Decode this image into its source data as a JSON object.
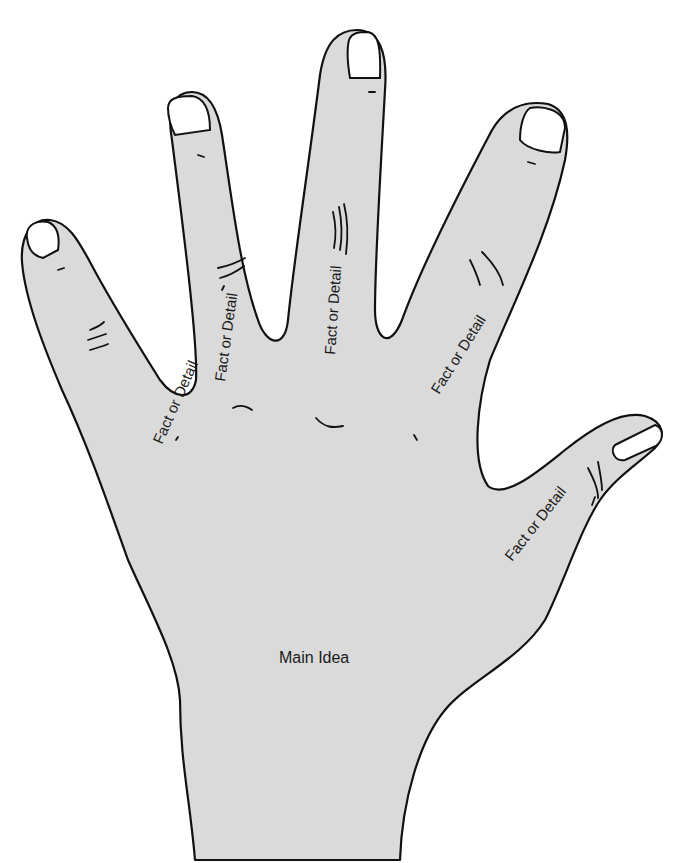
{
  "diagram": {
    "type": "hand-graphic-organizer",
    "colors": {
      "skin": "#dadada",
      "outline": "#111111",
      "nail": "#ffffff",
      "background": "#ffffff"
    },
    "palm": {
      "label": "Main Idea"
    },
    "fingers": [
      {
        "id": "pinky",
        "label": "Fact or Detail"
      },
      {
        "id": "ring",
        "label": "Fact or Detail"
      },
      {
        "id": "middle",
        "label": "Fact or Detail"
      },
      {
        "id": "index",
        "label": "Fact or Detail"
      },
      {
        "id": "thumb",
        "label": "Fact or Detail"
      }
    ]
  }
}
